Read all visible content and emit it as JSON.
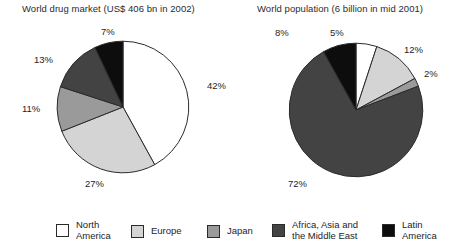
{
  "charts": [
    {
      "title": "World drug market (US$ 406 bn in 2002)",
      "labels": [
        "42%",
        "27%",
        "11%",
        "13%",
        "7%"
      ]
    },
    {
      "title": "World population (6 billion in mid 2001)",
      "labels": [
        "5%",
        "12%",
        "2%",
        "72%",
        "8%"
      ]
    }
  ],
  "legend": {
    "items": [
      {
        "label": "North\nAmerica",
        "color": "#ffffff"
      },
      {
        "label": "Europe",
        "color": "#d4d4d4"
      },
      {
        "label": "Japan",
        "color": "#9a9a9a"
      },
      {
        "label": "Africa, Asia and\nthe Middle East",
        "color": "#434343"
      },
      {
        "label": "Latin\nAmerica",
        "color": "#0d0d0d"
      }
    ]
  },
  "chart_data": [
    {
      "type": "pie",
      "title": "World drug market (US$ 406 bn in 2002)",
      "categories": [
        "North America",
        "Europe",
        "Japan",
        "Africa, Asia and the Middle East",
        "Latin America"
      ],
      "values": [
        42,
        27,
        11,
        13,
        7
      ],
      "data_labels": [
        "42%",
        "27%",
        "11%",
        "13%",
        "7%"
      ],
      "colors": [
        "#ffffff",
        "#d4d4d4",
        "#9a9a9a",
        "#434343",
        "#0d0d0d"
      ],
      "units": "percent",
      "legend": "bottom, shared",
      "start_angle_deg": 0,
      "direction": "clockwise"
    },
    {
      "type": "pie",
      "title": "World population (6 billion in mid 2001)",
      "categories": [
        "North America",
        "Europe",
        "Japan",
        "Africa, Asia and the Middle East",
        "Latin America"
      ],
      "values": [
        5,
        12,
        2,
        72,
        8
      ],
      "data_labels": [
        "5%",
        "12%",
        "2%",
        "72%",
        "8%"
      ],
      "colors": [
        "#ffffff",
        "#d4d4d4",
        "#9a9a9a",
        "#434343",
        "#0d0d0d"
      ],
      "units": "percent",
      "legend": "bottom, shared",
      "start_angle_deg": 0,
      "direction": "clockwise"
    }
  ]
}
